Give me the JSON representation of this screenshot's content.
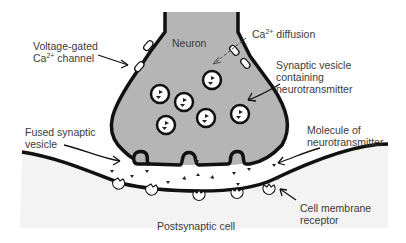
{
  "diagram": {
    "colors": {
      "neuron_fill": "#b5b5b5",
      "postsynaptic_fill": "#f3f3f3",
      "cleft_fill": "#ffffff",
      "outline": "#111111",
      "text": "#3a3a3a"
    },
    "labels": {
      "neuron": "Neuron",
      "voltage_gated_line1": "Voltage-gated",
      "voltage_gated_line2_prefix": "Ca",
      "voltage_gated_line2_sup": "2+",
      "voltage_gated_line2_suffix": " channel",
      "ca_diffusion_prefix": "Ca",
      "ca_diffusion_sup": "2+",
      "ca_diffusion_suffix": " diffusion",
      "synaptic_vesicle_line1": "Synaptic vesicle",
      "synaptic_vesicle_line2": "containing",
      "synaptic_vesicle_line3": "neurotransmitter",
      "fused_vesicle_line1": "Fused synaptic",
      "fused_vesicle_line2": "vesicle",
      "molecule_line1": "Molecule of",
      "molecule_line2": "neurotransmitter",
      "receptor_line1": "Cell membrane",
      "receptor_line2": "receptor",
      "postsynaptic": "Postsynaptic cell"
    },
    "vesicle_count": 7,
    "fused_vesicle_count": 3,
    "receptor_count": 5
  }
}
